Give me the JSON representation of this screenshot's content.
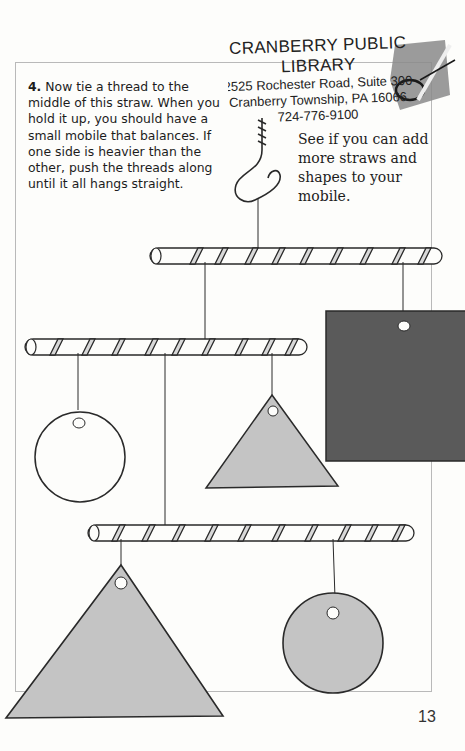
{
  "stamp": {
    "name": "CRANBERRY PUBLIC LIBRARY",
    "address": "2525 Rochester Road, Suite 300",
    "city": "Cranberry Township, PA 16066",
    "phone": "724-776-9100"
  },
  "instructions": {
    "step_number": "4.",
    "text": "Now tie a thread to the middle of this straw. When you hold it up, you should have a small mobile that balances. If one side is heavier than the other, push the threads along until it all hangs straight."
  },
  "tip": {
    "text": "See if you can add more straws and shapes to your mobile."
  },
  "illustration": {
    "hook": "hook-icon",
    "straws": 3,
    "shapes": [
      "dark-square",
      "white-circle",
      "gray-triangle",
      "large-gray-triangle",
      "gray-circle"
    ],
    "colors": {
      "dark_square": "#5a5a5a",
      "gray_shape": "#c4c4c4",
      "outline": "#2a2a2a"
    }
  },
  "page_number": "13"
}
